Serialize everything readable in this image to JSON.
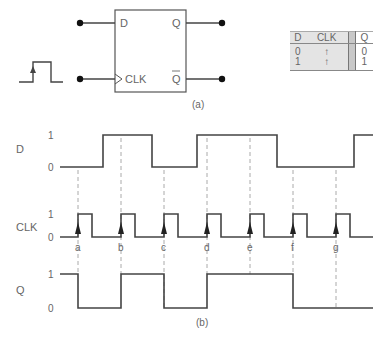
{
  "flipflop": {
    "pin_d": "D",
    "pin_clk": "CLK",
    "pin_q": "Q",
    "pin_qbar": "Q",
    "caption": "(a)"
  },
  "truth_table": {
    "headers": [
      "D",
      "CLK",
      "Q"
    ],
    "rows": [
      {
        "d": "0",
        "clk": "↑",
        "q": "0"
      },
      {
        "d": "1",
        "clk": "↑",
        "q": "1"
      }
    ]
  },
  "timing": {
    "caption": "(b)",
    "signals": [
      {
        "name": "D",
        "high_label": "1",
        "low_label": "0"
      },
      {
        "name": "CLK",
        "high_label": "1",
        "low_label": "0"
      },
      {
        "name": "Q",
        "high_label": "1",
        "low_label": "0"
      }
    ],
    "clock_edges": [
      "a",
      "b",
      "c",
      "d",
      "e",
      "f",
      "g"
    ]
  },
  "colors": {
    "line": "#444444",
    "dashed": "#aaaaaa",
    "text": "#666666",
    "table_fill": "#e4e4e4",
    "table_separator": "#c8c8c8"
  }
}
